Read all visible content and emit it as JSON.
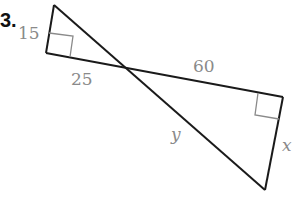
{
  "problem_number": "3.",
  "labels": {
    "side_left_leg": "15",
    "side_left_base": "25",
    "side_right_base": "60",
    "side_right_leg": "x",
    "hypotenuse_right": "y"
  },
  "colors": {
    "line": "#1a1a1a",
    "right_angle_mark": "#8a8a8a",
    "label": "#8a8a8a"
  }
}
